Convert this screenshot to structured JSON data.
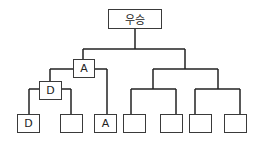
{
  "diagram": {
    "type": "tournament-bracket",
    "root": {
      "label": "우승"
    },
    "nodes": {
      "semifinal_left": {
        "label": "A"
      },
      "quarterfinal_left": {
        "label": "D"
      },
      "leaves": [
        {
          "label": "D"
        },
        {
          "label": ""
        },
        {
          "label": "A"
        },
        {
          "label": ""
        },
        {
          "label": ""
        },
        {
          "label": ""
        },
        {
          "label": ""
        }
      ]
    },
    "line_color": "#222222"
  }
}
